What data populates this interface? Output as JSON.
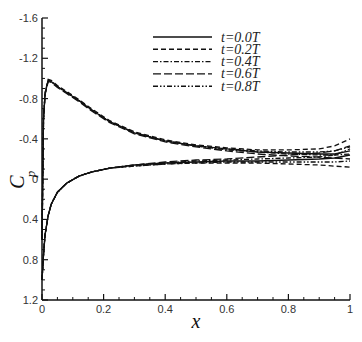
{
  "chart_data": {
    "type": "line",
    "title": "",
    "xlabel": "x",
    "ylabel": "C_p",
    "xlim": [
      0,
      1
    ],
    "ylim": [
      1.2,
      -1.6
    ],
    "y_inverted": true,
    "grid": false,
    "legend_position": "upper-center",
    "xticks": [
      "0",
      "0.2",
      "0.4",
      "0.6",
      "0.8",
      "1"
    ],
    "yticks": [
      "-1.6",
      "-1.2",
      "-0.8",
      "-0.4",
      "0",
      "0.4",
      "0.8",
      "1.2"
    ],
    "series": [
      {
        "name": "t=0.0T",
        "style": "solid",
        "upper": {
          "x": [
            0.0,
            0.005,
            0.01,
            0.02,
            0.03,
            0.05,
            0.08,
            0.12,
            0.16,
            0.22,
            0.3,
            0.4,
            0.5,
            0.6,
            0.7,
            0.8,
            0.9,
            0.95,
            1.0
          ],
          "y": [
            0.6,
            -0.6,
            -0.85,
            -0.98,
            -0.97,
            -0.92,
            -0.86,
            -0.78,
            -0.69,
            -0.57,
            -0.46,
            -0.38,
            -0.33,
            -0.3,
            -0.27,
            -0.26,
            -0.25,
            -0.25,
            -0.28
          ]
        },
        "lower": {
          "x": [
            0.0,
            0.005,
            0.01,
            0.02,
            0.03,
            0.05,
            0.08,
            0.12,
            0.16,
            0.22,
            0.3,
            0.4,
            0.5,
            0.6,
            0.7,
            0.8,
            0.9,
            0.95,
            1.0
          ],
          "y": [
            1.0,
            0.75,
            0.55,
            0.36,
            0.25,
            0.13,
            0.04,
            -0.03,
            -0.07,
            -0.11,
            -0.14,
            -0.16,
            -0.17,
            -0.18,
            -0.18,
            -0.19,
            -0.2,
            -0.21,
            -0.24
          ]
        }
      },
      {
        "name": "t=0.2T",
        "style": "dashed",
        "upper": {
          "x": [
            0.0,
            0.005,
            0.01,
            0.02,
            0.03,
            0.05,
            0.08,
            0.12,
            0.16,
            0.22,
            0.3,
            0.4,
            0.5,
            0.6,
            0.7,
            0.8,
            0.9,
            0.95,
            1.0
          ],
          "y": [
            0.6,
            -0.6,
            -0.86,
            -0.99,
            -0.98,
            -0.93,
            -0.87,
            -0.79,
            -0.7,
            -0.58,
            -0.47,
            -0.39,
            -0.34,
            -0.31,
            -0.29,
            -0.29,
            -0.3,
            -0.33,
            -0.4
          ]
        },
        "lower": {
          "x": [
            0.0,
            0.005,
            0.01,
            0.02,
            0.03,
            0.05,
            0.08,
            0.12,
            0.16,
            0.22,
            0.3,
            0.4,
            0.5,
            0.6,
            0.7,
            0.8,
            0.9,
            0.95,
            1.0
          ],
          "y": [
            1.0,
            0.75,
            0.55,
            0.36,
            0.25,
            0.13,
            0.04,
            -0.03,
            -0.07,
            -0.11,
            -0.13,
            -0.15,
            -0.16,
            -0.16,
            -0.16,
            -0.15,
            -0.14,
            -0.13,
            -0.12
          ]
        }
      },
      {
        "name": "t=0.4T",
        "style": "dash-dot",
        "upper": {
          "x": [
            0.0,
            0.005,
            0.01,
            0.02,
            0.03,
            0.05,
            0.08,
            0.12,
            0.16,
            0.22,
            0.3,
            0.4,
            0.5,
            0.6,
            0.7,
            0.8,
            0.9,
            0.95,
            1.0
          ],
          "y": [
            0.6,
            -0.6,
            -0.85,
            -0.98,
            -0.97,
            -0.92,
            -0.86,
            -0.78,
            -0.69,
            -0.57,
            -0.46,
            -0.38,
            -0.33,
            -0.29,
            -0.27,
            -0.25,
            -0.24,
            -0.24,
            -0.25
          ]
        },
        "lower": {
          "x": [
            0.0,
            0.005,
            0.01,
            0.02,
            0.03,
            0.05,
            0.08,
            0.12,
            0.16,
            0.22,
            0.3,
            0.4,
            0.5,
            0.6,
            0.7,
            0.8,
            0.9,
            0.95,
            1.0
          ],
          "y": [
            1.0,
            0.75,
            0.55,
            0.36,
            0.25,
            0.13,
            0.04,
            -0.03,
            -0.07,
            -0.11,
            -0.14,
            -0.16,
            -0.18,
            -0.19,
            -0.2,
            -0.21,
            -0.22,
            -0.24,
            -0.3
          ]
        }
      },
      {
        "name": "t=0.6T",
        "style": "long-dash",
        "upper": {
          "x": [
            0.0,
            0.005,
            0.01,
            0.02,
            0.03,
            0.05,
            0.08,
            0.12,
            0.16,
            0.22,
            0.3,
            0.4,
            0.5,
            0.6,
            0.7,
            0.8,
            0.9,
            0.95,
            1.0
          ],
          "y": [
            0.6,
            -0.6,
            -0.84,
            -0.97,
            -0.96,
            -0.91,
            -0.85,
            -0.77,
            -0.68,
            -0.56,
            -0.45,
            -0.37,
            -0.32,
            -0.28,
            -0.25,
            -0.23,
            -0.22,
            -0.21,
            -0.2
          ]
        },
        "lower": {
          "x": [
            0.0,
            0.005,
            0.01,
            0.02,
            0.03,
            0.05,
            0.08,
            0.12,
            0.16,
            0.22,
            0.3,
            0.4,
            0.5,
            0.6,
            0.7,
            0.8,
            0.9,
            0.95,
            1.0
          ],
          "y": [
            1.0,
            0.75,
            0.55,
            0.36,
            0.25,
            0.13,
            0.04,
            -0.03,
            -0.07,
            -0.11,
            -0.14,
            -0.17,
            -0.19,
            -0.2,
            -0.22,
            -0.24,
            -0.26,
            -0.28,
            -0.33
          ]
        }
      },
      {
        "name": "t=0.8T",
        "style": "dash-dot-dot",
        "upper": {
          "x": [
            0.0,
            0.005,
            0.01,
            0.02,
            0.03,
            0.05,
            0.08,
            0.12,
            0.16,
            0.22,
            0.3,
            0.4,
            0.5,
            0.6,
            0.7,
            0.8,
            0.9,
            0.95,
            1.0
          ],
          "y": [
            0.6,
            -0.6,
            -0.85,
            -0.98,
            -0.97,
            -0.92,
            -0.86,
            -0.78,
            -0.69,
            -0.57,
            -0.46,
            -0.38,
            -0.33,
            -0.3,
            -0.28,
            -0.27,
            -0.27,
            -0.28,
            -0.32
          ]
        },
        "lower": {
          "x": [
            0.0,
            0.005,
            0.01,
            0.02,
            0.03,
            0.05,
            0.08,
            0.12,
            0.16,
            0.22,
            0.3,
            0.4,
            0.5,
            0.6,
            0.7,
            0.8,
            0.9,
            0.95,
            1.0
          ],
          "y": [
            1.0,
            0.75,
            0.55,
            0.36,
            0.25,
            0.13,
            0.04,
            -0.03,
            -0.07,
            -0.11,
            -0.13,
            -0.15,
            -0.16,
            -0.17,
            -0.17,
            -0.17,
            -0.17,
            -0.17,
            -0.18
          ]
        }
      }
    ]
  },
  "labels": {
    "xlabel": "x",
    "ylabel_main": "C",
    "ylabel_sub": "p"
  }
}
